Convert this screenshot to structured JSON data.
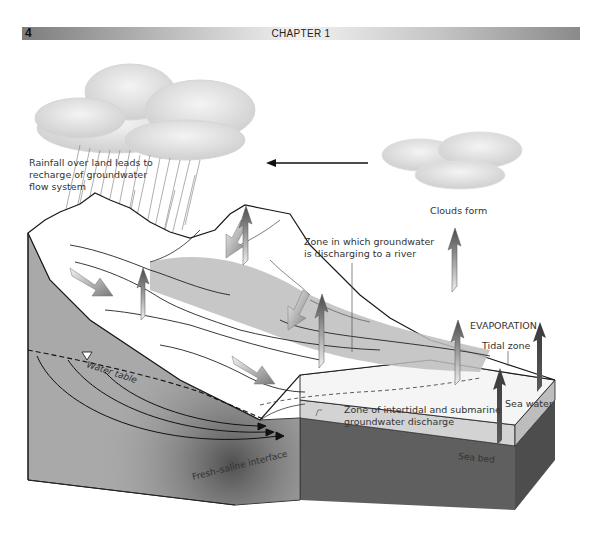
{
  "header": {
    "page_number": "4",
    "chapter_title": "CHAPTER 1"
  },
  "diagram": {
    "labels": {
      "rainfall_line1": "Rainfall over land leads to",
      "rainfall_line2": "recharge of groundwater",
      "rainfall_line3": "flow system",
      "clouds_form": "Clouds form",
      "river_zone_line1": "Zone in which groundwater",
      "river_zone_line2": "is discharging to a river",
      "evaporation": "EVAPORATION",
      "tidal_zone": "Tidal zone",
      "water_table": "Water table",
      "intertidal_line1": "Zone of intertidal and submarine",
      "intertidal_line2": "groundwater discharge",
      "sea_water": "Sea water",
      "sea_bed": "Sea bed",
      "fresh_saline": "Fresh–saline interface"
    },
    "colors": {
      "groundwater": "#a9a9a9",
      "sea_block_side": "#5f5f5f",
      "sea_surface": "#dcdcdc",
      "discharge_zone": "#bdbdbd",
      "arrow_dark": "#4a4a4a",
      "arrow_light": "#e6e6e6"
    }
  }
}
